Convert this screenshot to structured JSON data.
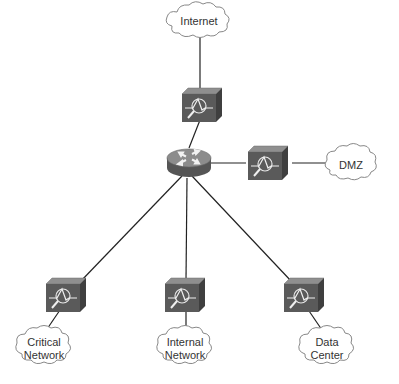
{
  "diagram": {
    "nodes": [
      {
        "id": "internet",
        "type": "cloud",
        "label_lines": [
          "Internet"
        ]
      },
      {
        "id": "ips-top",
        "type": "ips-appliance"
      },
      {
        "id": "router",
        "type": "router"
      },
      {
        "id": "ips-dmz",
        "type": "ips-appliance"
      },
      {
        "id": "dmz",
        "type": "cloud",
        "label_lines": [
          "DMZ"
        ]
      },
      {
        "id": "ips-critical",
        "type": "ips-appliance"
      },
      {
        "id": "ips-internal",
        "type": "ips-appliance"
      },
      {
        "id": "ips-datacenter",
        "type": "ips-appliance"
      },
      {
        "id": "critical-network",
        "type": "cloud",
        "label_lines": [
          "Critical",
          "Network"
        ]
      },
      {
        "id": "internal-network",
        "type": "cloud",
        "label_lines": [
          "Internal",
          "Network"
        ]
      },
      {
        "id": "data-center",
        "type": "cloud",
        "label_lines": [
          "Data",
          "Center"
        ]
      }
    ],
    "edges": [
      [
        "internet",
        "ips-top"
      ],
      [
        "ips-top",
        "router"
      ],
      [
        "router",
        "ips-dmz"
      ],
      [
        "ips-dmz",
        "dmz"
      ],
      [
        "router",
        "ips-critical"
      ],
      [
        "router",
        "ips-internal"
      ],
      [
        "router",
        "ips-datacenter"
      ],
      [
        "ips-critical",
        "critical-network"
      ],
      [
        "ips-internal",
        "internal-network"
      ],
      [
        "ips-datacenter",
        "data-center"
      ]
    ],
    "colors": {
      "line": "#222222",
      "appliance_front": "#5a5a5a",
      "appliance_top": "#8a8a8a",
      "appliance_side": "#444444",
      "router_body": "#6a6a6a",
      "router_top": "#9a9a9a",
      "cloud_fill": "#ffffff",
      "cloud_stroke": "#888888"
    }
  }
}
